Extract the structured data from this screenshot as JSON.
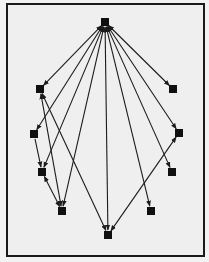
{
  "diagram": {
    "type": "directed-graph",
    "frame": {
      "x": 7,
      "y": 4,
      "width": 197,
      "height": 252
    },
    "colors": {
      "background": "#efefef",
      "border": "#1a1a1a",
      "node": "#101010",
      "edge": "#1c1c1c"
    },
    "node_size": 8,
    "nodes": [
      {
        "id": "T",
        "x": 105,
        "y": 22
      },
      {
        "id": "L1",
        "x": 40,
        "y": 89
      },
      {
        "id": "R1",
        "x": 173,
        "y": 89
      },
      {
        "id": "L2",
        "x": 34,
        "y": 134
      },
      {
        "id": "R2",
        "x": 179,
        "y": 133
      },
      {
        "id": "L3",
        "x": 42,
        "y": 172
      },
      {
        "id": "R3",
        "x": 172,
        "y": 172
      },
      {
        "id": "L4",
        "x": 62,
        "y": 211
      },
      {
        "id": "R4",
        "x": 151,
        "y": 211
      },
      {
        "id": "B",
        "x": 108,
        "y": 235
      }
    ],
    "edges": [
      {
        "from": "T",
        "to": "L1",
        "bidirectional": true
      },
      {
        "from": "T",
        "to": "L2",
        "bidirectional": true
      },
      {
        "from": "T",
        "to": "L3",
        "bidirectional": true
      },
      {
        "from": "T",
        "to": "L4",
        "bidirectional": true
      },
      {
        "from": "T",
        "to": "B",
        "bidirectional": true
      },
      {
        "from": "T",
        "to": "R4",
        "bidirectional": true
      },
      {
        "from": "T",
        "to": "R3",
        "bidirectional": true
      },
      {
        "from": "T",
        "to": "R2",
        "bidirectional": true
      },
      {
        "from": "T",
        "to": "R1",
        "bidirectional": true
      },
      {
        "from": "L1",
        "to": "L4",
        "bidirectional": true
      },
      {
        "from": "L1",
        "to": "B",
        "bidirectional": true
      },
      {
        "from": "L2",
        "to": "L3",
        "bidirectional": false
      },
      {
        "from": "L3",
        "to": "L4",
        "bidirectional": true
      },
      {
        "from": "R2",
        "to": "B",
        "bidirectional": true
      }
    ]
  }
}
